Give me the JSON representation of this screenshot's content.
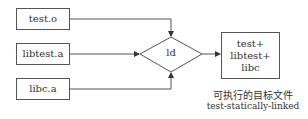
{
  "inputs": [
    {
      "label": "test.o"
    },
    {
      "label": "libtest.a"
    },
    {
      "label": "libc.a"
    }
  ],
  "linker": {
    "label": "ld"
  },
  "output": {
    "lines": [
      "test+",
      "libtest+",
      "libc"
    ]
  },
  "caption": {
    "title": "可执行的目标文件",
    "filename": "test-statically-linked"
  }
}
